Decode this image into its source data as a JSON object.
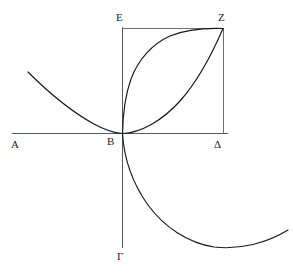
{
  "figure": {
    "kind": "geometric-diagram",
    "background_color": "#ffffff",
    "curve_color": "#15181a",
    "axis_color": "#555a5e",
    "square_color": "#6a6f73",
    "labels": [
      {
        "name": "A",
        "text": "Α",
        "x": 11,
        "y": 139
      },
      {
        "name": "B",
        "text": "B",
        "x": 107,
        "y": 136
      },
      {
        "name": "G",
        "text": "Γ",
        "x": 117,
        "y": 251
      },
      {
        "name": "D",
        "text": "Δ",
        "x": 214,
        "y": 139
      },
      {
        "name": "E",
        "text": "E",
        "x": 116,
        "y": 12
      },
      {
        "name": "Z",
        "text": "Z",
        "x": 218,
        "y": 12
      }
    ],
    "points": {
      "B": {
        "x": 122,
        "y": 133
      },
      "E": {
        "x": 122,
        "y": 28
      },
      "Z": {
        "x": 223,
        "y": 28
      },
      "D": {
        "x": 223,
        "y": 133
      }
    },
    "axes": {
      "horizontal": {
        "name": "axis-AB-Delta",
        "x1": 12,
        "y1": 133,
        "x2": 228,
        "y2": 133
      },
      "vertical": {
        "name": "axis-B-Gamma",
        "x1": 122,
        "y1": 27,
        "x2": 122,
        "y2": 248
      }
    },
    "square": {
      "name": "square-BEZDelta",
      "top": {
        "x1": 122,
        "y1": 28,
        "x2": 223,
        "y2": 28
      },
      "right": {
        "x1": 223,
        "y1": 28,
        "x2": 223,
        "y2": 133
      }
    },
    "curves": [
      {
        "name": "parabola-upper-left",
        "role": "parabola tangent to x-axis at B, passing through Z, extending up-left",
        "path": "M 28 72 C 55 96 95 126 122 133 C 148 140 178 110 199 76 C 210 58 218 41 223 28"
      },
      {
        "name": "parabola-lower-right",
        "role": "parabola tangent to y-axis at B, passing through Z, extending down-right",
        "path": "M 122 28 C 122 28 122 28 122 28 M 123 27 C 131 47 146 76 166 96 C 186 116 208 127 223 28"
      },
      {
        "name": "parabola-inner-rising",
        "role": "inner arc from B rising steeply to Z",
        "path": "M 122 133 C 124 104 131 76 145 58 C 165 34 200 28 223 28"
      },
      {
        "name": "parabola-inner-shallow",
        "role": "inner arc from B sweeping right then up to Z",
        "path": "M 122 133 C 152 131 182 118 201 96 C 215 79 221 52 223 28"
      },
      {
        "name": "parabola-lower-branch",
        "role": "continuation below x-axis from B down to the right",
        "path": "M 122 133 C 126 166 147 205 175 228 C 202 250 248 250 288 230"
      }
    ]
  }
}
